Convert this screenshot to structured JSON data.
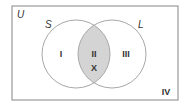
{
  "diagram": {
    "type": "venn",
    "universe": {
      "label": "U",
      "region_label": "IV"
    },
    "sets": [
      {
        "label": "S",
        "region_label": "I"
      },
      {
        "label": "L",
        "region_label": "III"
      }
    ],
    "intersection": {
      "region_label": "II",
      "element": "X",
      "shaded": true
    },
    "colors": {
      "border": "#9a9a9a",
      "shade": "#d4d4d4",
      "text": "#333333",
      "background": "#ffffff"
    }
  }
}
